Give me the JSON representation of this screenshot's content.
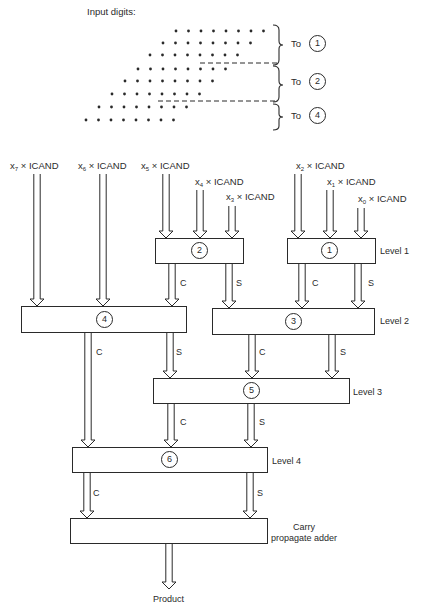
{
  "diagram": {
    "input_title": "Input digits:",
    "dot_rows": [
      {
        "start_x": 176,
        "y": 31,
        "count": 8
      },
      {
        "start_x": 163,
        "y": 43,
        "count": 8
      },
      {
        "start_x": 150,
        "y": 55,
        "count": 8
      },
      {
        "start_x": 138,
        "y": 69,
        "count": 8
      },
      {
        "start_x": 125,
        "y": 81,
        "count": 8
      },
      {
        "start_x": 112,
        "y": 94,
        "count": 8
      },
      {
        "start_x": 99,
        "y": 107,
        "count": 8
      },
      {
        "start_x": 86,
        "y": 120,
        "count": 8
      }
    ],
    "groups": [
      {
        "to_label": "To",
        "target": "1"
      },
      {
        "to_label": "To",
        "target": "2"
      },
      {
        "to_label": "To",
        "target": "4"
      }
    ],
    "inputs": [
      {
        "var": "x",
        "sub": "7",
        "op": "×",
        "operand": "ICAND"
      },
      {
        "var": "x",
        "sub": "6",
        "op": "×",
        "operand": "ICAND"
      },
      {
        "var": "x",
        "sub": "5",
        "op": "×",
        "operand": "ICAND"
      },
      {
        "var": "x",
        "sub": "4",
        "op": "×",
        "operand": "ICAND"
      },
      {
        "var": "x",
        "sub": "3",
        "op": "×",
        "operand": "ICAND"
      },
      {
        "var": "x",
        "sub": "2",
        "op": "×",
        "operand": "ICAND"
      },
      {
        "var": "x",
        "sub": "1",
        "op": "×",
        "operand": "ICAND"
      },
      {
        "var": "x",
        "sub": "0",
        "op": "×",
        "operand": "ICAND"
      }
    ],
    "adders": [
      {
        "id": "1",
        "level": "Level 1"
      },
      {
        "id": "2",
        "level": ""
      },
      {
        "id": "3",
        "level": "Level 2"
      },
      {
        "id": "4",
        "level": ""
      },
      {
        "id": "5",
        "level": "Level 3"
      },
      {
        "id": "6",
        "level": "Level 4"
      }
    ],
    "carry_label": "C",
    "sum_label": "S",
    "final_adder": {
      "line1": "Carry",
      "line2": "propagate adder"
    },
    "output_label": "Product"
  }
}
